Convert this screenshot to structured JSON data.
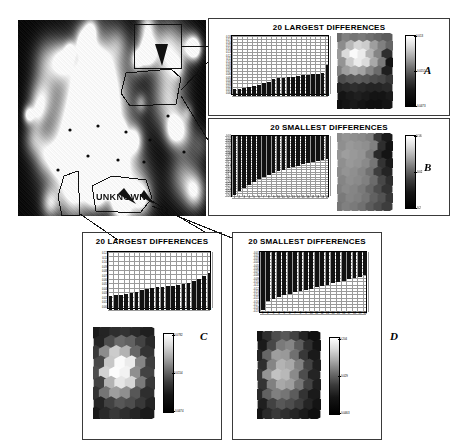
{
  "figure": {
    "unknown_label": "UNKNOWN",
    "panel_letters": [
      "A",
      "B",
      "C",
      "D"
    ],
    "title_largest": "20 LARGEST DIFFERENCES",
    "title_smallest": "20 SMALLEST DIFFERENCES"
  },
  "main_map": {
    "name": "som-component-plane",
    "background_color": "#0d0d0d",
    "bright_color": "#f2f2f2"
  },
  "panels": [
    {
      "letter": "A",
      "title": "20 LARGEST DIFFERENCES",
      "layout": "horizontal",
      "colorbar": {
        "top": "0.013",
        "mid": "-0.0151",
        "bottom": "-0.0473"
      }
    },
    {
      "letter": "B",
      "title": "20 SMALLEST DIFFERENCES",
      "layout": "horizontal",
      "colorbar": {
        "top": "0.16",
        "mid": "-0.02",
        "bottom": "-0.2"
      }
    },
    {
      "letter": "C",
      "title": "20 LARGEST DIFFERENCES",
      "layout": "vertical",
      "colorbar": {
        "top": "0.0782",
        "mid": "0.0154",
        "bottom": "-0.0474"
      }
    },
    {
      "letter": "D",
      "title": "20 SMALLEST DIFFERENCES",
      "layout": "vertical",
      "colorbar": {
        "top": "0.204",
        "mid": "-0.029",
        "bottom": "-0.0463"
      }
    }
  ],
  "chart_data": [
    {
      "type": "bar",
      "panel": "A",
      "title": "20 LARGEST DIFFERENCES",
      "xlabel": "",
      "ylabel": "",
      "categories": [
        "1",
        "2",
        "3",
        "4",
        "5",
        "6",
        "7",
        "8",
        "9",
        "10",
        "11",
        "12",
        "13",
        "14",
        "15",
        "16",
        "17",
        "18",
        "19",
        "20"
      ],
      "values": [
        0.02,
        0.021,
        0.023,
        0.026,
        0.03,
        0.034,
        0.039,
        0.043,
        0.051,
        0.053,
        0.055,
        0.057,
        0.058,
        0.06,
        0.062,
        0.063,
        0.065,
        0.067,
        0.069,
        0.092
      ],
      "ylim": [
        0,
        0.18
      ],
      "yticks": [
        "0.18",
        "0.17",
        "0.16",
        "0.15",
        "0.14",
        "0.13",
        "0.12",
        "0.11",
        "0.10",
        "0.09",
        "0.08",
        "0.07",
        "0.06",
        "0.05",
        "0.04",
        "0.03",
        "0.02",
        "0.01",
        "0.00"
      ],
      "grid": true
    },
    {
      "type": "bar",
      "panel": "B",
      "title": "20 SMALLEST DIFFERENCES",
      "xlabel": "",
      "ylabel": "",
      "categories": [
        "1",
        "2",
        "3",
        "4",
        "5",
        "6",
        "7",
        "8",
        "9",
        "10",
        "11",
        "12",
        "13",
        "14",
        "15",
        "16",
        "17",
        "18",
        "19",
        "20"
      ],
      "values": [
        -0.247,
        -0.232,
        -0.218,
        -0.205,
        -0.193,
        -0.182,
        -0.172,
        -0.163,
        -0.155,
        -0.148,
        -0.141,
        -0.135,
        -0.129,
        -0.124,
        -0.119,
        -0.114,
        -0.11,
        -0.106,
        -0.102,
        -0.098
      ],
      "ylim": [
        -0.26,
        0
      ],
      "yticks": [
        "-0.01",
        "-0.02",
        "-0.03",
        "-0.04",
        "-0.05",
        "-0.06",
        "-0.07",
        "-0.08",
        "-0.09",
        "-0.10",
        "-0.11",
        "-0.12",
        "-0.13",
        "-0.14",
        "-0.15",
        "-0.16",
        "-0.17",
        "-0.18",
        "-0.19",
        "-0.20",
        "-0.21",
        "-0.22",
        "-0.23",
        "-0.24",
        "-0.25",
        "-0.26"
      ],
      "grid": true
    },
    {
      "type": "bar",
      "panel": "C",
      "title": "20 LARGEST DIFFERENCES",
      "xlabel": "",
      "ylabel": "",
      "categories": [
        "1",
        "2",
        "3",
        "4",
        "5",
        "6",
        "7",
        "8",
        "9",
        "10",
        "11",
        "12",
        "13",
        "14",
        "15",
        "16",
        "17",
        "18",
        "19",
        "20"
      ],
      "values": [
        0.03,
        0.031,
        0.032,
        0.034,
        0.036,
        0.038,
        0.041,
        0.043,
        0.046,
        0.047,
        0.048,
        0.049,
        0.05,
        0.051,
        0.053,
        0.056,
        0.06,
        0.065,
        0.07,
        0.076
      ],
      "ylim": [
        0,
        0.12
      ],
      "yticks": [
        "0.12",
        "0.11",
        "0.10",
        "0.09",
        "0.08",
        "0.07",
        "0.06",
        "0.05",
        "0.04",
        "0.03",
        "0.02",
        "0.01",
        "0.00"
      ],
      "grid": true
    },
    {
      "type": "bar",
      "panel": "D",
      "title": "20 SMALLEST DIFFERENCES",
      "xlabel": "",
      "ylabel": "",
      "categories": [
        "1",
        "2",
        "3",
        "4",
        "5",
        "6",
        "7",
        "8",
        "9",
        "10",
        "11",
        "12",
        "13",
        "14",
        "15",
        "16",
        "17",
        "18",
        "19",
        "20"
      ],
      "values": [
        -0.178,
        -0.15,
        -0.143,
        -0.138,
        -0.133,
        -0.128,
        -0.124,
        -0.12,
        -0.116,
        -0.112,
        -0.108,
        -0.104,
        -0.1,
        -0.096,
        -0.092,
        -0.088,
        -0.084,
        -0.08,
        -0.076,
        -0.072
      ],
      "ylim": [
        -0.19,
        0
      ],
      "yticks": [
        "-0.01",
        "-0.02",
        "-0.03",
        "-0.04",
        "-0.05",
        "-0.06",
        "-0.07",
        "-0.08",
        "-0.09",
        "-0.10",
        "-0.11",
        "-0.12",
        "-0.13",
        "-0.14",
        "-0.15",
        "-0.16",
        "-0.17",
        "-0.18",
        "-0.19"
      ],
      "grid": true
    }
  ],
  "hexmaps": [
    {
      "panel": "A",
      "cols": 7,
      "rows": 9,
      "values": [
        0.42,
        0.5,
        0.46,
        0.48,
        0.44,
        0.4,
        0.36,
        0.55,
        0.72,
        0.84,
        0.8,
        0.62,
        0.5,
        0.4,
        0.6,
        0.86,
        0.98,
        0.92,
        0.7,
        0.52,
        0.18,
        0.58,
        0.8,
        0.92,
        0.86,
        0.66,
        0.48,
        0.08,
        0.5,
        0.62,
        0.68,
        0.64,
        0.52,
        0.42,
        0.12,
        0.3,
        0.34,
        0.36,
        0.34,
        0.3,
        0.28,
        0.22,
        0.14,
        0.16,
        0.18,
        0.16,
        0.14,
        0.14,
        0.16,
        0.08,
        0.1,
        0.12,
        0.1,
        0.08,
        0.08,
        0.1,
        0.06,
        0.08,
        0.1,
        0.08,
        0.06,
        0.06,
        0.08
      ]
    },
    {
      "panel": "B",
      "cols": 7,
      "rows": 9,
      "values": [
        0.55,
        0.58,
        0.56,
        0.54,
        0.5,
        0.22,
        0.1,
        0.56,
        0.6,
        0.58,
        0.56,
        0.5,
        0.18,
        0.08,
        0.58,
        0.62,
        0.6,
        0.58,
        0.48,
        0.16,
        0.08,
        0.56,
        0.6,
        0.58,
        0.54,
        0.46,
        0.2,
        0.1,
        0.54,
        0.58,
        0.56,
        0.52,
        0.44,
        0.24,
        0.14,
        0.52,
        0.56,
        0.54,
        0.5,
        0.42,
        0.28,
        0.18,
        0.5,
        0.54,
        0.52,
        0.48,
        0.4,
        0.3,
        0.2,
        0.48,
        0.52,
        0.5,
        0.46,
        0.38,
        0.32,
        0.22,
        0.46,
        0.5,
        0.48,
        0.44,
        0.36,
        0.3,
        0.24
      ]
    },
    {
      "panel": "C",
      "cols": 6,
      "rows": 9,
      "values": [
        0.1,
        0.14,
        0.18,
        0.2,
        0.16,
        0.12,
        0.14,
        0.3,
        0.42,
        0.38,
        0.26,
        0.16,
        0.22,
        0.55,
        0.8,
        0.7,
        0.4,
        0.2,
        0.28,
        0.78,
        0.98,
        0.92,
        0.52,
        0.24,
        0.3,
        0.82,
        0.99,
        0.95,
        0.56,
        0.26,
        0.26,
        0.7,
        0.9,
        0.84,
        0.48,
        0.22,
        0.2,
        0.46,
        0.62,
        0.56,
        0.34,
        0.18,
        0.14,
        0.26,
        0.34,
        0.3,
        0.22,
        0.14,
        0.1,
        0.16,
        0.22,
        0.18,
        0.14,
        0.1
      ]
    },
    {
      "panel": "D",
      "cols": 7,
      "rows": 9,
      "values": [
        0.08,
        0.18,
        0.3,
        0.34,
        0.26,
        0.14,
        0.06,
        0.1,
        0.28,
        0.48,
        0.52,
        0.36,
        0.18,
        0.08,
        0.14,
        0.4,
        0.62,
        0.6,
        0.44,
        0.22,
        0.1,
        0.18,
        0.52,
        0.7,
        0.66,
        0.5,
        0.26,
        0.12,
        0.22,
        0.58,
        0.76,
        0.72,
        0.54,
        0.3,
        0.14,
        0.2,
        0.5,
        0.66,
        0.62,
        0.46,
        0.26,
        0.12,
        0.16,
        0.38,
        0.5,
        0.46,
        0.36,
        0.2,
        0.1,
        0.12,
        0.26,
        0.34,
        0.3,
        0.24,
        0.14,
        0.08,
        0.08,
        0.16,
        0.22,
        0.18,
        0.14,
        0.1,
        0.06
      ]
    }
  ]
}
